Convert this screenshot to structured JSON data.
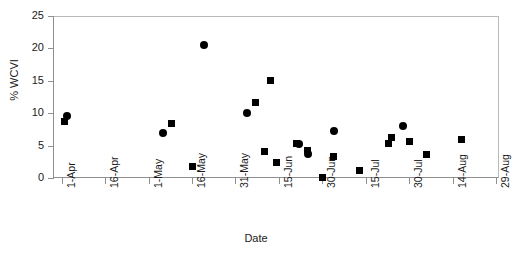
{
  "chart_data": {
    "type": "scatter",
    "title": "",
    "xlabel": "Date",
    "ylabel": "% WCVI",
    "ylim": [
      0,
      25
    ],
    "ytick_values": [
      0,
      5,
      10,
      15,
      20,
      25
    ],
    "ytick_labels": [
      "0",
      "5",
      "10",
      "15",
      "20",
      "25"
    ],
    "xtick_labels": [
      "1-Apr",
      "16-Apr",
      "1-May",
      "16-May",
      "31-May",
      "15-Jun",
      "30-Jun",
      "15-Jul",
      "30-Jul",
      "14-Aug",
      "29-Aug",
      "13-Sep"
    ],
    "xtick_days": [
      0,
      15,
      30,
      45,
      60,
      75,
      90,
      105,
      120,
      135,
      150,
      165
    ],
    "xlim_days": [
      -3,
      151
    ],
    "grid": false,
    "legend": false,
    "marker_color": "#000000",
    "series": [
      {
        "name": "square-series",
        "marker": "square",
        "points": [
          {
            "date": "2-Apr",
            "day": 1,
            "value": 8.7
          },
          {
            "date": "16-May",
            "day": 45,
            "value": 1.7
          },
          {
            "date": "9-May",
            "day": 38,
            "value": 8.4
          },
          {
            "date": "7-Jun",
            "day": 67,
            "value": 11.7
          },
          {
            "date": "12-Jun",
            "day": 72,
            "value": 15.1
          },
          {
            "date": "10-Jun",
            "day": 70,
            "value": 4.1
          },
          {
            "date": "14-Jun",
            "day": 74,
            "value": 2.4
          },
          {
            "date": "21-Jun",
            "day": 81,
            "value": 5.4
          },
          {
            "date": "25-Jun",
            "day": 85,
            "value": 4.3
          },
          {
            "date": "30-Jun",
            "day": 90,
            "value": 0.1
          },
          {
            "date": "4-Jul",
            "day": 94,
            "value": 3.3
          },
          {
            "date": "13-Jul",
            "day": 103,
            "value": 1.1
          },
          {
            "date": "24-Jul",
            "day": 114,
            "value": 6.3
          },
          {
            "date": "23-Jul",
            "day": 113,
            "value": 5.3
          },
          {
            "date": "30-Jul",
            "day": 120,
            "value": 5.6
          },
          {
            "date": "5-Aug",
            "day": 126,
            "value": 3.6
          },
          {
            "date": "17-Aug",
            "day": 138,
            "value": 5.9
          },
          {
            "date": "11-Sep",
            "day": 163,
            "value": 4.3
          }
        ]
      },
      {
        "name": "circle-series",
        "marker": "circle",
        "points": [
          {
            "date": "3-Apr",
            "day": 2,
            "value": 9.6
          },
          {
            "date": "6-May",
            "day": 35,
            "value": 7.0
          },
          {
            "date": "20-May",
            "day": 49,
            "value": 20.6
          },
          {
            "date": "4-Jun",
            "day": 64,
            "value": 10.0
          },
          {
            "date": "22-Jun",
            "day": 82,
            "value": 5.3
          },
          {
            "date": "25-Jun",
            "day": 85,
            "value": 3.7
          },
          {
            "date": "4-Jul",
            "day": 94,
            "value": 7.3
          },
          {
            "date": "28-Jul",
            "day": 118,
            "value": 8.0
          },
          {
            "date": "5-Sep",
            "day": 157,
            "value": 5.8
          }
        ]
      }
    ]
  }
}
